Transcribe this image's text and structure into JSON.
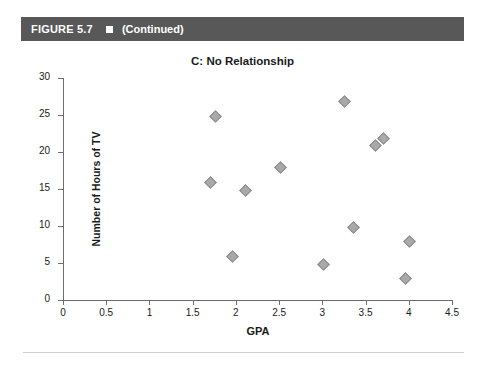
{
  "figure": {
    "label": "FIGURE 5.7",
    "marker_icon": "filled-square-icon",
    "continued_text": "(Continued)",
    "bar_color": "#585858",
    "text_color": "#ffffff"
  },
  "chart_data": {
    "type": "scatter",
    "title": "C: No Relationship",
    "xlabel": "GPA",
    "ylabel": "Number of Hours of TV",
    "xlim": [
      0,
      4.5
    ],
    "ylim": [
      0,
      30
    ],
    "xticks": [
      "0",
      "0.5",
      "1",
      "1.5",
      "2",
      "2.5",
      "3",
      "3.5",
      "4",
      "4.5"
    ],
    "xtick_values": [
      0,
      0.5,
      1,
      1.5,
      2,
      2.5,
      3,
      3.5,
      4,
      4.5
    ],
    "yticks": [
      "0",
      "5",
      "10",
      "15",
      "20",
      "25",
      "30"
    ],
    "ytick_values": [
      0,
      5,
      10,
      15,
      20,
      25,
      30
    ],
    "grid": false,
    "legend": null,
    "marker": "diamond",
    "marker_color": "#a9a9a9",
    "points": [
      {
        "x": 1.75,
        "y": 25
      },
      {
        "x": 1.7,
        "y": 16
      },
      {
        "x": 1.95,
        "y": 6
      },
      {
        "x": 2.1,
        "y": 15
      },
      {
        "x": 2.5,
        "y": 18
      },
      {
        "x": 3.0,
        "y": 5
      },
      {
        "x": 3.25,
        "y": 27
      },
      {
        "x": 3.35,
        "y": 10
      },
      {
        "x": 3.6,
        "y": 21
      },
      {
        "x": 3.7,
        "y": 22
      },
      {
        "x": 3.95,
        "y": 3
      },
      {
        "x": 4.0,
        "y": 8
      }
    ]
  }
}
